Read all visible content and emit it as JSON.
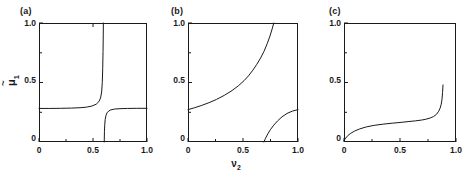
{
  "figure": {
    "background": "#ffffff",
    "line_color": "#1a1a1a",
    "panel_count": 3
  },
  "axis_labels": {
    "y_label_base": "μ",
    "y_label_sub": "1",
    "y_label_accent": "~",
    "y_label_plain": "μ̃1",
    "x_label_base": "ν",
    "x_label_sub": "2",
    "x_label_plain": "ν2"
  },
  "panels": [
    {
      "tag": "(a)",
      "y_ticks": [
        "1.0",
        "0.5",
        "0"
      ],
      "x_ticks": [
        "0",
        "0.5",
        "1.0"
      ],
      "show_y_label": true,
      "show_x_label": false
    },
    {
      "tag": "(b)",
      "y_ticks": [
        "1.0",
        "0.5",
        "0"
      ],
      "x_ticks": [
        "0",
        "0.5",
        "1.0"
      ],
      "show_y_label": false,
      "show_x_label": true
    },
    {
      "tag": "(c)",
      "y_ticks": [
        "1.0",
        "0.5",
        "0"
      ],
      "x_ticks": [
        "0",
        "0.5",
        "1.0"
      ],
      "show_y_label": false,
      "show_x_label": false
    }
  ],
  "chart_data": {
    "type": "line",
    "title": "",
    "xlabel": "ν2",
    "ylabel": "μ̃1",
    "xlim": [
      0,
      1
    ],
    "ylim": [
      0,
      1
    ],
    "grid": false,
    "legend": "none",
    "x_ticks_values": [
      0,
      0.5,
      1.0
    ],
    "y_ticks_values": [
      0,
      0.5,
      1.0
    ],
    "panels": [
      {
        "tag": "(a)",
        "series": [
          {
            "name": "lower-plateau-to-asymptote",
            "comment": "flat near 0.28 then diverges upward at nu2 ~ 0.60",
            "x": [
              0.0,
              0.1,
              0.2,
              0.3,
              0.38,
              0.44,
              0.49,
              0.53,
              0.555,
              0.57,
              0.58,
              0.586,
              0.59,
              0.593,
              0.595,
              0.596
            ],
            "y": [
              0.282,
              0.282,
              0.283,
              0.285,
              0.288,
              0.293,
              0.302,
              0.318,
              0.34,
              0.37,
              0.42,
              0.5,
              0.62,
              0.76,
              0.9,
              1.0
            ]
          },
          {
            "name": "upper-branch-returning-to-plateau",
            "comment": "rises from 0 at nu2 ~ 0.605 to plateau 0.28",
            "x": [
              0.604,
              0.606,
              0.609,
              0.613,
              0.62,
              0.63,
              0.645,
              0.665,
              0.7,
              0.75,
              0.82,
              0.9,
              1.0
            ],
            "y": [
              0.0,
              0.09,
              0.15,
              0.19,
              0.222,
              0.245,
              0.26,
              0.27,
              0.277,
              0.28,
              0.282,
              0.283,
              0.283
            ]
          }
        ]
      },
      {
        "tag": "(b)",
        "series": [
          {
            "name": "main-rising-branch",
            "comment": "starts 0.28 at nu2=0, rises steeply, reaches 1.0 at nu2 ~ 0.78",
            "x": [
              0.0,
              0.06,
              0.12,
              0.19,
              0.26,
              0.33,
              0.4,
              0.46,
              0.51,
              0.55,
              0.59,
              0.625,
              0.66,
              0.69,
              0.72,
              0.745,
              0.765,
              0.78
            ],
            "y": [
              0.272,
              0.288,
              0.306,
              0.33,
              0.358,
              0.392,
              0.432,
              0.474,
              0.516,
              0.556,
              0.604,
              0.652,
              0.706,
              0.76,
              0.826,
              0.89,
              0.95,
              1.0
            ]
          },
          {
            "name": "lower-right-branch",
            "comment": "emerges from y=0 at nu2 ~ 0.69 and climbs to ~0.27 at nu2=1",
            "x": [
              0.69,
              0.705,
              0.725,
              0.75,
              0.78,
              0.815,
              0.855,
              0.9,
              0.95,
              1.0
            ],
            "y": [
              0.0,
              0.032,
              0.068,
              0.105,
              0.142,
              0.178,
              0.212,
              0.24,
              0.26,
              0.272
            ]
          }
        ]
      },
      {
        "tag": "(c)",
        "series": [
          {
            "name": "slow-rise-then-sharp-upturn",
            "comment": "near 0 at nu2=0, slowly to ~0.18 at nu2 ~ 0.72, sharp upturn ending ~0.48 at nu2 ~ 0.88",
            "x": [
              0.0,
              0.015,
              0.035,
              0.06,
              0.095,
              0.14,
              0.2,
              0.27,
              0.35,
              0.43,
              0.51,
              0.58,
              0.64,
              0.69,
              0.73,
              0.77,
              0.8,
              0.825,
              0.845,
              0.858,
              0.868,
              0.875,
              0.88,
              0.884
            ],
            "y": [
              0.012,
              0.032,
              0.055,
              0.073,
              0.092,
              0.11,
              0.127,
              0.14,
              0.15,
              0.158,
              0.165,
              0.172,
              0.178,
              0.184,
              0.191,
              0.202,
              0.214,
              0.232,
              0.258,
              0.284,
              0.318,
              0.36,
              0.415,
              0.48
            ]
          }
        ]
      }
    ]
  }
}
